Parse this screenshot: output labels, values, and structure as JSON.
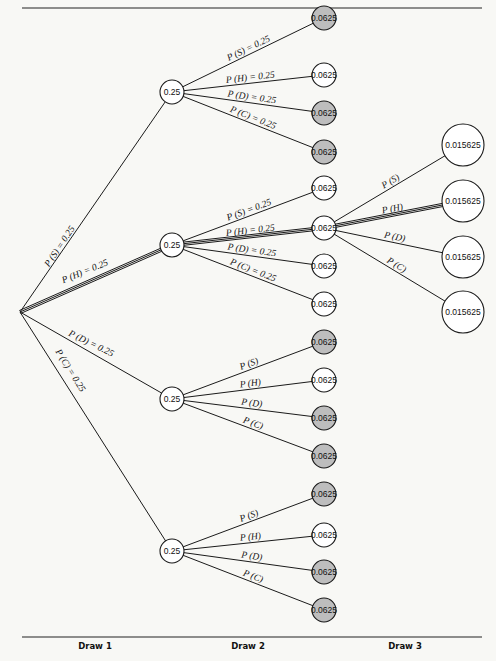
{
  "colors": {
    "background": "#f8f8f5",
    "node_shaded": "#bdbdbd",
    "node_plain": "#ffffff",
    "line": "#1a1a1a"
  },
  "root": {
    "x": 20,
    "y": 312
  },
  "draw1_nodes": [
    {
      "id": "S",
      "x": 172,
      "y": 92,
      "r": 12,
      "value": "0.25",
      "shaded": false,
      "edge_label": "P (S) = 0.25",
      "highlight": false,
      "label_pos": {
        "x": 62,
        "y": 248,
        "rot": -56
      }
    },
    {
      "id": "H",
      "x": 172,
      "y": 245,
      "r": 12,
      "value": "0.25",
      "shaded": false,
      "edge_label": "P (H) = 0.25",
      "highlight": true,
      "label_pos": {
        "x": 86,
        "y": 274,
        "rot": -22
      }
    },
    {
      "id": "D",
      "x": 172,
      "y": 399,
      "r": 12,
      "value": "0.25",
      "shaded": false,
      "edge_label": "P (D) = 0.25",
      "highlight": false,
      "label_pos": {
        "x": 90,
        "y": 346,
        "rot": 26
      }
    },
    {
      "id": "C",
      "x": 172,
      "y": 551,
      "r": 12,
      "value": "0.25",
      "shaded": false,
      "edge_label": "P (C) = 0.25",
      "highlight": false,
      "label_pos": {
        "x": 68,
        "y": 372,
        "rot": 58
      }
    }
  ],
  "draw2_groups": [
    {
      "parent": 0,
      "children": [
        {
          "label": "P (S) = 0.25",
          "value": "0.0625",
          "x": 324,
          "y": 18,
          "shaded": true,
          "highlight": false
        },
        {
          "label": "P (H) = 0.25",
          "value": "0.0625",
          "x": 324,
          "y": 75,
          "shaded": false,
          "highlight": false
        },
        {
          "label": "P (D) = 0.25",
          "value": "0.0625",
          "x": 324,
          "y": 113,
          "shaded": true,
          "highlight": false
        },
        {
          "label": "P (C) = 0.25",
          "value": "0.0625",
          "x": 324,
          "y": 152,
          "shaded": true,
          "highlight": false
        }
      ]
    },
    {
      "parent": 1,
      "children": [
        {
          "label": "P (S) = 0.25",
          "value": "0.0625",
          "x": 324,
          "y": 188,
          "shaded": false,
          "highlight": false
        },
        {
          "label": "P (H) = 0.25",
          "value": "0.0625",
          "x": 324,
          "y": 228,
          "shaded": false,
          "highlight": true
        },
        {
          "label": "P (D) = 0.25",
          "value": "0.0625",
          "x": 324,
          "y": 266,
          "shaded": false,
          "highlight": false
        },
        {
          "label": "P (C) = 0.25",
          "value": "0.0625",
          "x": 324,
          "y": 304,
          "shaded": false,
          "highlight": false
        }
      ]
    },
    {
      "parent": 2,
      "children": [
        {
          "label": "P (S)",
          "value": "0.0625",
          "x": 324,
          "y": 342,
          "shaded": true,
          "highlight": false
        },
        {
          "label": "P (H)",
          "value": "0.0625",
          "x": 324,
          "y": 380,
          "shaded": false,
          "highlight": false
        },
        {
          "label": "P (D)",
          "value": "0.0625",
          "x": 324,
          "y": 418,
          "shaded": true,
          "highlight": false
        },
        {
          "label": "P (C)",
          "value": "0.0625",
          "x": 324,
          "y": 456,
          "shaded": true,
          "highlight": false
        }
      ]
    },
    {
      "parent": 3,
      "children": [
        {
          "label": "P (S)",
          "value": "0.0625",
          "x": 324,
          "y": 494,
          "shaded": true,
          "highlight": false
        },
        {
          "label": "P (H)",
          "value": "0.0625",
          "x": 324,
          "y": 535,
          "shaded": false,
          "highlight": false
        },
        {
          "label": "P (D)",
          "value": "0.0625",
          "x": 324,
          "y": 572,
          "shaded": true,
          "highlight": false
        },
        {
          "label": "P (C)",
          "value": "0.0625",
          "x": 324,
          "y": 610,
          "shaded": true,
          "highlight": false
        }
      ]
    }
  ],
  "draw3": {
    "from": {
      "x": 324,
      "y": 228
    },
    "children": [
      {
        "label": "P (S)",
        "value": "0.015625",
        "x": 463,
        "y": 145,
        "shaded": false,
        "highlight": false
      },
      {
        "label": "P (H)",
        "value": "0.015625",
        "x": 463,
        "y": 201,
        "shaded": false,
        "highlight": true
      },
      {
        "label": "P (D)",
        "value": "0.015625",
        "x": 463,
        "y": 257,
        "shaded": false,
        "highlight": false
      },
      {
        "label": "P (C)",
        "value": "0.015625",
        "x": 463,
        "y": 312,
        "shaded": false,
        "highlight": false
      }
    ]
  },
  "axis": {
    "labels": [
      "Draw 1",
      "Draw 2",
      "Draw 3"
    ],
    "label_x": [
      95,
      248,
      405
    ],
    "label_y": 649
  },
  "rules": {
    "top_y": 8,
    "bottom_y": 637,
    "x1": 22,
    "x2": 482
  }
}
